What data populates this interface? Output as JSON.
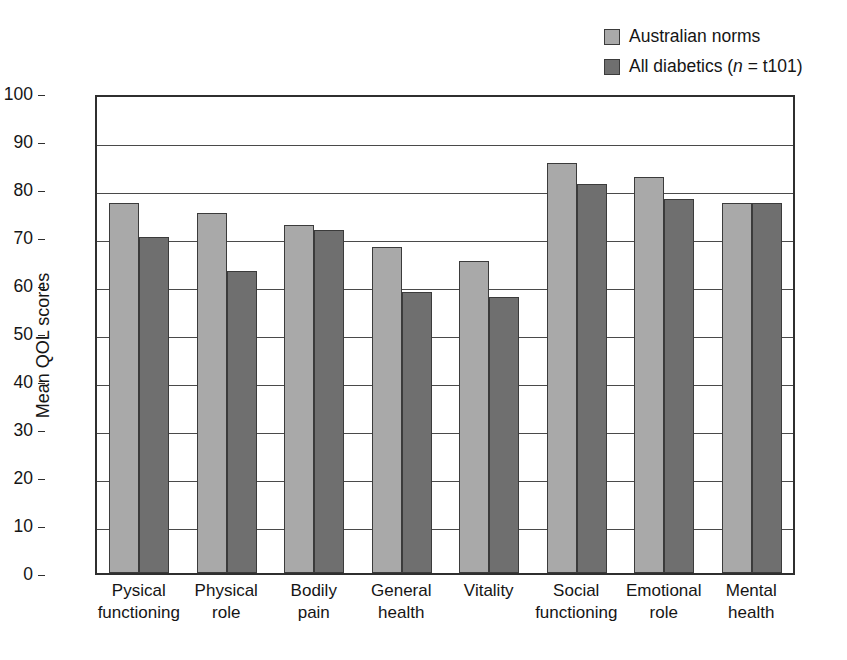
{
  "chart_data": {
    "type": "bar",
    "title": "",
    "xlabel": "",
    "ylabel": "Mean QOL scores",
    "ylim": [
      0,
      100
    ],
    "ytick_step": 10,
    "yticks": [
      0,
      10,
      20,
      30,
      40,
      50,
      60,
      70,
      80,
      90,
      100
    ],
    "grid": true,
    "legend_position": "top-right",
    "categories": [
      "Pysical functioning",
      "Physical role",
      "Bodily pain",
      "General health",
      "Vitality",
      "Social functioning",
      "Emotional role",
      "Mental health"
    ],
    "category_lines": [
      [
        "Pysical",
        "functioning"
      ],
      [
        "Physical",
        "role"
      ],
      [
        "Bodily",
        "pain"
      ],
      [
        "General",
        "health"
      ],
      [
        "Vitality",
        ""
      ],
      [
        "Social",
        "functioning"
      ],
      [
        "Emotional",
        "role"
      ],
      [
        "Mental",
        "health"
      ]
    ],
    "series": [
      {
        "name": "Australian norms",
        "color": "#a9a9a9",
        "values": [
          77.0,
          75.0,
          72.5,
          68.0,
          65.0,
          85.5,
          82.5,
          77.0
        ]
      },
      {
        "name": "All diabetics (n = t101)",
        "color": "#6f6f6f",
        "values": [
          70.0,
          63.0,
          71.5,
          58.5,
          57.5,
          81.0,
          78.0,
          77.0
        ]
      }
    ]
  },
  "legend": {
    "items": [
      {
        "label": "Australian norms",
        "color": "#a9a9a9",
        "prefix": "Australian norms",
        "italic": "",
        "suffix": ""
      },
      {
        "label": "All diabetics (n = t101)",
        "color": "#6f6f6f",
        "prefix": "All diabetics (",
        "italic": "n",
        "suffix": " = t101)"
      }
    ]
  },
  "axes": {
    "y_title": "Mean QOL scores",
    "y_labels": [
      "100",
      "90",
      "80",
      "70",
      "60",
      "50",
      "40",
      "30",
      "20",
      "10",
      "0"
    ]
  }
}
